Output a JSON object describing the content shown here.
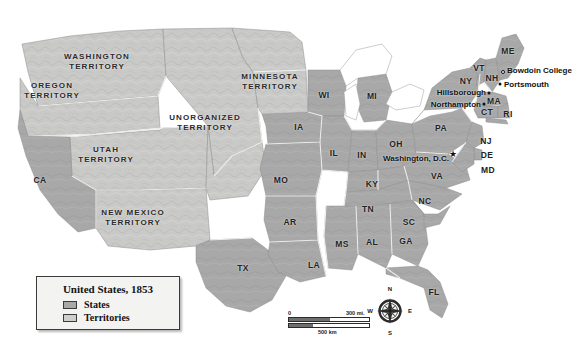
{
  "map": {
    "title": "United States, 1853",
    "colors": {
      "state_fill": "#a8a8a8",
      "territory_fill": "#c9c9c7",
      "water": "#ffffff",
      "border": "#f2f2f2",
      "coast": "#8d8d8d",
      "label": "#1b1b1b",
      "legend_bg": "#f3f3f1",
      "legend_border": "#3a3a3a"
    },
    "legend": {
      "title": "United States, 1853",
      "entries": [
        {
          "label": "States",
          "swatch": "#a8a8a8"
        },
        {
          "label": "Territories",
          "swatch": "#c9c9c7"
        }
      ]
    },
    "scalebar": {
      "miles_zero": "0",
      "miles_value": "300 mi.",
      "km_zero": "0",
      "km_value": "500 km"
    },
    "compass": {
      "north": "N",
      "south": "S",
      "east": "E",
      "west": "W"
    },
    "territories": [
      {
        "name": "Washington Territory",
        "line1": "WASHINGTON",
        "line2": "TERRITORY",
        "x": 97,
        "y": 62
      },
      {
        "name": "Oregon Territory",
        "line1": "OREGON",
        "line2": "TERRITORY",
        "x": 52,
        "y": 91
      },
      {
        "name": "Minnesota Territory",
        "line1": "MINNESOTA",
        "line2": "TERRITORY",
        "x": 270,
        "y": 82
      },
      {
        "name": "Unorganized Territory",
        "line1": "UNORGANIZED",
        "line2": "TERRITORY",
        "x": 205,
        "y": 123
      },
      {
        "name": "Utah Territory",
        "line1": "UTAH",
        "line2": "TERRITORY",
        "x": 106,
        "y": 155
      },
      {
        "name": "New Mexico Territory",
        "line1": "NEW MEXICO",
        "line2": "TERRITORY",
        "x": 133,
        "y": 218
      }
    ],
    "states": [
      {
        "abbr": "CA",
        "x": 40,
        "y": 180
      },
      {
        "abbr": "TX",
        "x": 243,
        "y": 268
      },
      {
        "abbr": "IA",
        "x": 299,
        "y": 127
      },
      {
        "abbr": "MO",
        "x": 281,
        "y": 180
      },
      {
        "abbr": "AR",
        "x": 290,
        "y": 222
      },
      {
        "abbr": "LA",
        "x": 314,
        "y": 265
      },
      {
        "abbr": "MS",
        "x": 342,
        "y": 244
      },
      {
        "abbr": "AL",
        "x": 372,
        "y": 242
      },
      {
        "abbr": "GA",
        "x": 406,
        "y": 241
      },
      {
        "abbr": "FL",
        "x": 434,
        "y": 292
      },
      {
        "abbr": "SC",
        "x": 409,
        "y": 222
      },
      {
        "abbr": "NC",
        "x": 425,
        "y": 201
      },
      {
        "abbr": "TN",
        "x": 368,
        "y": 209
      },
      {
        "abbr": "KY",
        "x": 372,
        "y": 184
      },
      {
        "abbr": "IL",
        "x": 334,
        "y": 153
      },
      {
        "abbr": "IN",
        "x": 362,
        "y": 155
      },
      {
        "abbr": "OH",
        "x": 396,
        "y": 144
      },
      {
        "abbr": "WI",
        "x": 324,
        "y": 95
      },
      {
        "abbr": "MI",
        "x": 372,
        "y": 96
      },
      {
        "abbr": "PA",
        "x": 441,
        "y": 128
      },
      {
        "abbr": "VA",
        "x": 437,
        "y": 176
      },
      {
        "abbr": "MD",
        "x": 488,
        "y": 170
      },
      {
        "abbr": "DE",
        "x": 487,
        "y": 155
      },
      {
        "abbr": "NJ",
        "x": 486,
        "y": 141
      },
      {
        "abbr": "NY",
        "x": 466,
        "y": 81
      },
      {
        "abbr": "VT",
        "x": 479,
        "y": 68
      },
      {
        "abbr": "NH",
        "x": 492,
        "y": 78
      },
      {
        "abbr": "ME",
        "x": 508,
        "y": 51
      },
      {
        "abbr": "MA",
        "x": 494,
        "y": 101
      },
      {
        "abbr": "CT",
        "x": 487,
        "y": 112
      },
      {
        "abbr": "RI",
        "x": 508,
        "y": 114
      }
    ],
    "cities": [
      {
        "name": "Bowdoin College",
        "marker": "ring",
        "mx": 503,
        "my": 72,
        "lx": 507,
        "ly": 70,
        "align": "left"
      },
      {
        "name": "Portsmouth",
        "marker": "dot",
        "mx": 500,
        "my": 84,
        "lx": 504,
        "ly": 84,
        "align": "left"
      },
      {
        "name": "Hillsborough",
        "marker": "dot",
        "mx": 489,
        "my": 93,
        "lx": 486,
        "ly": 92,
        "align": "right"
      },
      {
        "name": "Northampton",
        "marker": "dot",
        "mx": 484,
        "my": 104,
        "lx": 481,
        "ly": 104,
        "align": "right"
      },
      {
        "name": "Washington, D.C.",
        "marker": "capital",
        "mx": 453,
        "my": 156,
        "lx": 449,
        "ly": 158,
        "align": "right"
      }
    ]
  }
}
